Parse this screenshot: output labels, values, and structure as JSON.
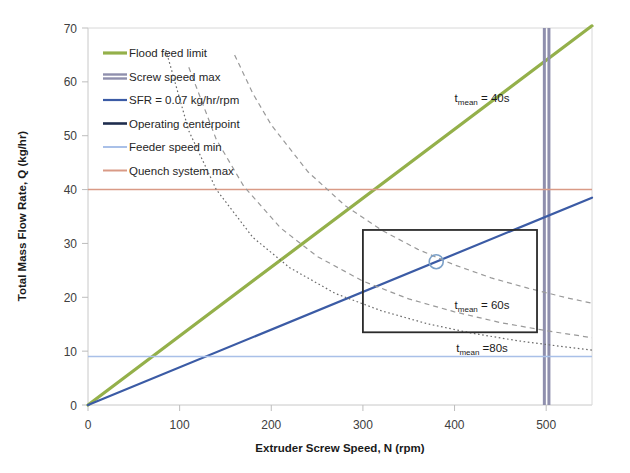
{
  "chart_data": {
    "type": "line",
    "title": "",
    "xlabel": "Extruder Screw Speed, N (rpm)",
    "ylabel": "Total Mass Flow Rate, Q (kg/hr)",
    "xlim": [
      0,
      550
    ],
    "ylim": [
      0,
      70
    ],
    "xticks": [
      "0",
      "100",
      "200",
      "300",
      "400",
      "500"
    ],
    "xtick_values": [
      0,
      100,
      200,
      300,
      400,
      500
    ],
    "yticks": [
      "0",
      "10",
      "20",
      "30",
      "40",
      "50",
      "60",
      "70"
    ],
    "ytick_values": [
      0,
      10,
      20,
      30,
      40,
      50,
      60,
      70
    ],
    "grid": false,
    "legend_position": "upper-left-inside",
    "series": [
      {
        "name": "Flood feed limit",
        "label": "Flood feed limit",
        "color": "#94b04a",
        "style": "solid",
        "width": 3.2,
        "kind": "ray",
        "slope": 0.128,
        "intercept": 0,
        "points": [
          [
            0,
            0
          ],
          [
            550,
            70.4
          ]
        ]
      },
      {
        "name": "Screw speed max",
        "label": "Screw speed max",
        "color": "#8f8fad",
        "style": "solid",
        "width": 3.0,
        "kind": "vline-pair",
        "x_values": [
          498,
          503
        ],
        "points": [
          [
            498,
            0
          ],
          [
            498,
            70
          ],
          [
            503,
            0
          ],
          [
            503,
            70
          ]
        ]
      },
      {
        "name": "SFR = 0.07 kg/hr/rpm",
        "label": "SFR = 0.07 kg/hr/rpm",
        "color": "#3b5ba5",
        "style": "solid",
        "width": 2.2,
        "kind": "ray",
        "slope": 0.07,
        "intercept": 0,
        "points": [
          [
            0,
            0
          ],
          [
            550,
            38.5
          ]
        ]
      },
      {
        "name": "Operating centerpoint",
        "label": "Operating centerpoint",
        "color": "#1f2d4e",
        "style": "solid",
        "width": 2.6,
        "kind": "marker",
        "points": [
          [
            380,
            26.6
          ]
        ]
      },
      {
        "name": "Feeder speed min",
        "label": "Feeder speed min",
        "color": "#a9c0e8",
        "style": "solid",
        "width": 1.6,
        "kind": "hline",
        "y_value": 9.0,
        "points": [
          [
            0,
            9.0
          ],
          [
            550,
            9.0
          ]
        ]
      },
      {
        "name": "Quench system max",
        "label": "Quench system max",
        "color": "#d99a86",
        "style": "solid",
        "width": 1.6,
        "kind": "hline",
        "y_value": 40.0,
        "points": [
          [
            0,
            40.0
          ],
          [
            550,
            40.0
          ]
        ]
      }
    ],
    "annotations": [
      {
        "name": "t-mean-40s",
        "text_main": "t",
        "text_sub": "mean",
        "text_rest": " = 40s",
        "label": "t_mean = 40s",
        "value_s": 40,
        "x": 430,
        "y": 57,
        "curve": {
          "style": "dashed",
          "color": "#9a9a9a",
          "width": 1.2,
          "k": 10400,
          "points": [
            [
              160,
              65
            ],
            [
              180,
              57.8
            ],
            [
              200,
              52
            ],
            [
              240,
              43.3
            ],
            [
              280,
              37.1
            ],
            [
              320,
              32.5
            ],
            [
              360,
              28.9
            ],
            [
              400,
              26
            ],
            [
              440,
              23.6
            ],
            [
              480,
              21.7
            ],
            [
              520,
              20
            ],
            [
              550,
              18.9
            ]
          ]
        }
      },
      {
        "name": "t-mean-60s",
        "text_main": "t",
        "text_sub": "mean",
        "text_rest": " = 60s",
        "label": "t_mean = 60s",
        "value_s": 60,
        "x": 430,
        "y": 18.5,
        "curve": {
          "style": "dashed",
          "color": "#9a9a9a",
          "width": 1.2,
          "k": 6900,
          "points": [
            [
              110,
              62.7
            ],
            [
              140,
              49.3
            ],
            [
              170,
              40.6
            ],
            [
              210,
              32.9
            ],
            [
              250,
              27.6
            ],
            [
              300,
              23
            ],
            [
              350,
              19.7
            ],
            [
              400,
              17.3
            ],
            [
              450,
              15.3
            ],
            [
              500,
              13.8
            ],
            [
              550,
              12.5
            ]
          ]
        }
      },
      {
        "name": "t-mean-80s",
        "text_main": "t",
        "text_sub": "mean",
        "text_rest": " =80s",
        "label": "t_mean =80s",
        "value_s": 80,
        "x": 430,
        "y": 10.6,
        "curve": {
          "style": "dotted",
          "color": "#6b6b6b",
          "width": 1.2,
          "k": 5600,
          "points": [
            [
              85,
              65.9
            ],
            [
              110,
              50.9
            ],
            [
              140,
              40
            ],
            [
              180,
              31.1
            ],
            [
              220,
              25.5
            ],
            [
              270,
              20.7
            ],
            [
              320,
              17.5
            ],
            [
              370,
              15.1
            ],
            [
              420,
              13.3
            ],
            [
              470,
              11.9
            ],
            [
              520,
              10.8
            ],
            [
              550,
              10.2
            ]
          ]
        }
      }
    ],
    "operating_window": {
      "name": "operating-window-box",
      "color": "#2b2b2b",
      "width": 1.8,
      "x_range": [
        300,
        490
      ],
      "y_range": [
        13.5,
        32.5
      ]
    },
    "centerpoint_marker": {
      "name": "operating-centerpoint-marker",
      "x": 380,
      "y": 26.6,
      "color": "#7ba0c8",
      "radius_px": 7
    }
  },
  "axes": {
    "x_title": "Extruder Screw Speed, N (rpm)",
    "y_title": "Total Mass Flow Rate, Q (kg/hr)"
  }
}
